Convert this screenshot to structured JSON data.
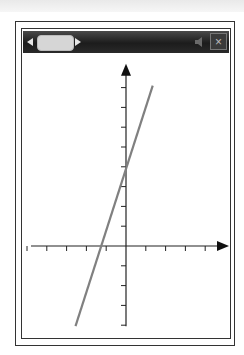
{
  "window": {
    "tab_nav_left": "◀",
    "tab_nav_right": "▶",
    "close_label": "×",
    "sound_icon": "speaker-icon"
  },
  "chart_data": {
    "type": "line",
    "title": "",
    "xlabel": "",
    "ylabel": "",
    "grid": false,
    "legend": null,
    "tick_labels": false,
    "xlim": [
      -5,
      5
    ],
    "ylim": [
      -4,
      9
    ],
    "x_ticks": [
      -5,
      -4,
      -3,
      -2,
      -1,
      1,
      2,
      3,
      4
    ],
    "y_ticks": [
      -4,
      -3,
      -2,
      -1,
      1,
      2,
      3,
      4,
      5,
      6,
      7,
      8
    ],
    "series": [
      {
        "name": "line",
        "color": "#808080",
        "equation": "y = 3x + 4",
        "x": [
          -2.55,
          1.35
        ],
        "y": [
          -4.05,
          8.1
        ]
      }
    ],
    "style": {
      "axis_color": "#222222",
      "line_color": "#808080",
      "px_per_unit": 19.8,
      "origin_px": [
        126,
        246
      ]
    }
  }
}
